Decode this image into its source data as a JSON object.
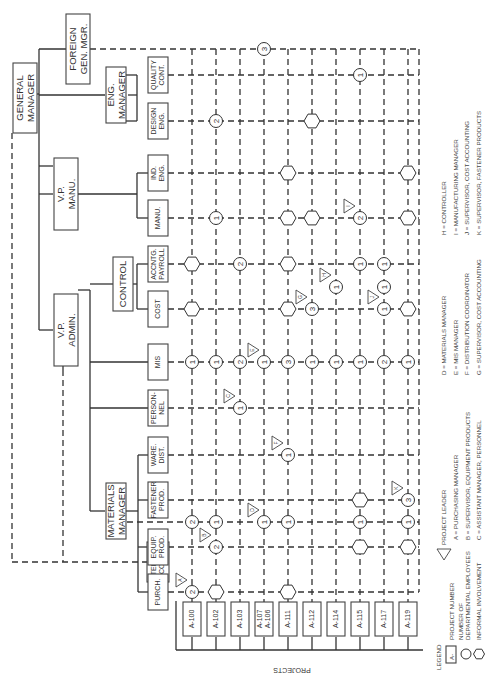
{
  "top": {
    "general_manager": [
      "GENERAL",
      "MANAGER"
    ],
    "foreign": [
      "FOREIGN",
      "GEN. MGR."
    ],
    "eng_manager": [
      "ENG.",
      "MANAGER"
    ],
    "vp_manu": [
      "V.P.",
      "MANU."
    ],
    "vp_admin": [
      "V.P.",
      "ADMIN."
    ],
    "control": [
      "CONTROL"
    ],
    "materials_manager": [
      "MATERIALS",
      "MANAGER"
    ],
    "steering": [
      "STEERING",
      "COMM."
    ]
  },
  "departments": [
    {
      "id": "quality",
      "label": [
        "QUALITY",
        "CONT."
      ]
    },
    {
      "id": "design",
      "label": [
        "DESIGN",
        "ENG."
      ]
    },
    {
      "id": "ind",
      "label": [
        "IND.",
        "ENG."
      ]
    },
    {
      "id": "manu",
      "label": [
        "MANU."
      ]
    },
    {
      "id": "acctg",
      "label": [
        "ACCNTG.",
        "PAYROLL"
      ]
    },
    {
      "id": "cost",
      "label": [
        "COST"
      ]
    },
    {
      "id": "mis",
      "label": [
        "MIS"
      ]
    },
    {
      "id": "personnel",
      "label": [
        "PERSON-",
        "NEL"
      ]
    },
    {
      "id": "ware",
      "label": [
        "WARE.",
        "DIST."
      ]
    },
    {
      "id": "fastener",
      "label": [
        "FASTENER",
        "PROD."
      ]
    },
    {
      "id": "equip",
      "label": [
        "EQUIP.",
        "PROD."
      ]
    },
    {
      "id": "purch",
      "label": [
        "PURCH."
      ]
    }
  ],
  "projects": [
    {
      "label": [
        "A-100"
      ]
    },
    {
      "label": [
        "A-102"
      ]
    },
    {
      "label": [
        "A-103"
      ]
    },
    {
      "label": [
        "A-107",
        "A-106"
      ]
    },
    {
      "label": [
        "A-111"
      ]
    },
    {
      "label": [
        "A-112"
      ]
    },
    {
      "label": [
        "A-114"
      ]
    },
    {
      "label": [
        "A-115"
      ]
    },
    {
      "label": [
        "A-117"
      ]
    },
    {
      "label": [
        "A-119"
      ]
    }
  ],
  "projects_axis_label": "PROJECTS",
  "nodes": [
    {
      "project": 0,
      "row": "purch",
      "type": "count",
      "value": "2",
      "leader": "A"
    },
    {
      "project": 0,
      "row": "materials",
      "type": "count",
      "value": "2"
    },
    {
      "project": 0,
      "row": "mis",
      "type": "count",
      "value": "1"
    },
    {
      "project": 0,
      "row": "cost",
      "type": "informal"
    },
    {
      "project": 0,
      "row": "acctg",
      "type": "informal"
    },
    {
      "project": 1,
      "row": "purch",
      "type": "informal"
    },
    {
      "project": 1,
      "row": "equip",
      "type": "count",
      "value": "2",
      "leader": "B"
    },
    {
      "project": 1,
      "row": "materials",
      "type": "count",
      "value": "1"
    },
    {
      "project": 1,
      "row": "mis",
      "type": "count",
      "value": "1"
    },
    {
      "project": 1,
      "row": "manu",
      "type": "count",
      "value": "1"
    },
    {
      "project": 1,
      "row": "design",
      "type": "count",
      "value": "2"
    },
    {
      "project": 2,
      "row": "personnel",
      "type": "count",
      "value": "1",
      "leader": "C"
    },
    {
      "project": 2,
      "row": "mis",
      "type": "count",
      "value": "2"
    },
    {
      "project": 2,
      "row": "acctg",
      "type": "count",
      "value": "2"
    },
    {
      "project": 3,
      "row": "materials",
      "type": "count",
      "value": "1",
      "leader": "D"
    },
    {
      "project": 3,
      "row": "mis",
      "type": "count",
      "value": "1",
      "leader": "E"
    },
    {
      "project": 3,
      "row": "foreign",
      "type": "count",
      "value": "3"
    },
    {
      "project": 4,
      "row": "purch",
      "type": "informal"
    },
    {
      "project": 4,
      "row": "materials",
      "type": "count",
      "value": "1"
    },
    {
      "project": 4,
      "row": "ware",
      "type": "count",
      "value": "1",
      "leader": "F"
    },
    {
      "project": 4,
      "row": "mis",
      "type": "count",
      "value": "3"
    },
    {
      "project": 4,
      "row": "cost",
      "type": "informal"
    },
    {
      "project": 4,
      "row": "acctg",
      "type": "informal"
    },
    {
      "project": 4,
      "row": "manu",
      "type": "informal"
    },
    {
      "project": 4,
      "row": "ind",
      "type": "informal"
    },
    {
      "project": 5,
      "row": "mis",
      "type": "count",
      "value": "1"
    },
    {
      "project": 5,
      "row": "cost",
      "type": "count",
      "value": "3",
      "leader": "G"
    },
    {
      "project": 5,
      "row": "manu",
      "type": "informal"
    },
    {
      "project": 5,
      "row": "design",
      "type": "informal"
    },
    {
      "project": 6,
      "row": "mis",
      "type": "count",
      "value": "1"
    },
    {
      "project": 6,
      "row": "cost_acctg",
      "type": "count",
      "value": "1",
      "leader": "H"
    },
    {
      "project": 7,
      "row": "equip",
      "type": "informal"
    },
    {
      "project": 7,
      "row": "materials",
      "type": "count",
      "value": "1"
    },
    {
      "project": 7,
      "row": "fastener",
      "type": "informal"
    },
    {
      "project": 7,
      "row": "mis",
      "type": "count",
      "value": "1"
    },
    {
      "project": 7,
      "row": "acctg",
      "type": "count",
      "value": "1"
    },
    {
      "project": 7,
      "row": "manu",
      "type": "count",
      "value": "2",
      "leader": "I"
    },
    {
      "project": 7,
      "row": "quality",
      "type": "count",
      "value": "1"
    },
    {
      "project": 8,
      "row": "mis",
      "type": "count",
      "value": "2"
    },
    {
      "project": 8,
      "row": "cost",
      "type": "count",
      "value": "1",
      "leader": "J"
    },
    {
      "project": 8,
      "row": "cost_acctg",
      "type": "count",
      "value": "1"
    },
    {
      "project": 8,
      "row": "acctg",
      "type": "count",
      "value": "1"
    },
    {
      "project": 9,
      "row": "equip",
      "type": "informal"
    },
    {
      "project": 9,
      "row": "materials",
      "type": "count",
      "value": "1"
    },
    {
      "project": 9,
      "row": "fastener",
      "type": "count",
      "value": "3",
      "leader": "K"
    },
    {
      "project": 9,
      "row": "mis",
      "type": "count",
      "value": "1"
    },
    {
      "project": 9,
      "row": "cost",
      "type": "informal"
    },
    {
      "project": 9,
      "row": "manu",
      "type": "informal"
    },
    {
      "project": 9,
      "row": "ind",
      "type": "informal"
    }
  ],
  "legend": {
    "title": "LEGEND",
    "project_number_symbol": "A-",
    "project_number": "PROJECT NUMBER",
    "employees": [
      "NUMBER OF",
      "DEPARTMENTAL EMPLOYEES"
    ],
    "informal": "INFORMAL INVOLVEMENT",
    "project_leader": "PROJECT LEADER",
    "leaders": [
      "A = PURCHASING MANAGER",
      "B = SUPERVISOR, EQUIPMENT PRODUCTS",
      "C = ASSISTANT MANAGER, PERSONNEL",
      "D = MATERIALS MANAGER",
      "E = MIS MANAGER",
      "F = DISTRIBUTION COORDINATOR",
      "G = SUPERVISOR, COST ACCOUNTING",
      "H = CONTROLLER",
      "I = MANUFACTURING MANAGER",
      "J = SUPERVISOR, COST ACCOUNTING",
      "K = SUPERVISOR, FASTENER PRODUCTS"
    ]
  }
}
